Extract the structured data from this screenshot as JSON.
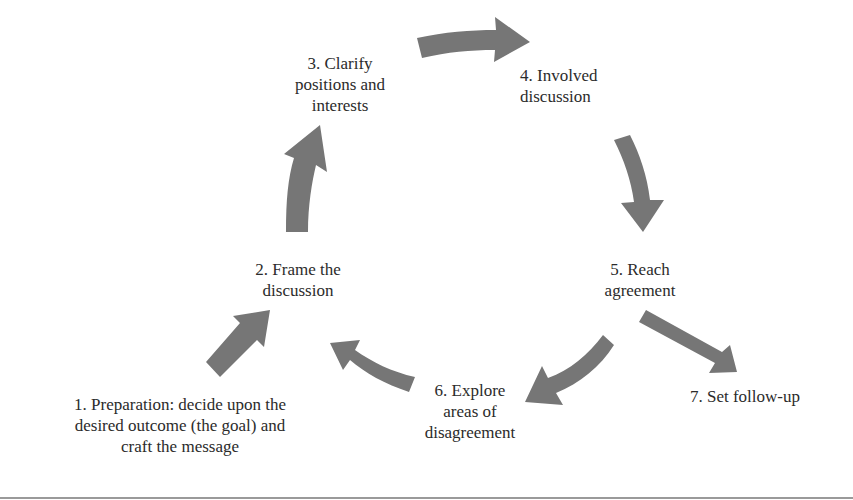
{
  "diagram": {
    "type": "process-cycle",
    "arrow_color": "#767676",
    "text_color": "#2b2b2b",
    "steps": [
      {
        "id": 1,
        "label": "1. Preparation: decide upon the\ndesired outcome (the goal) and\ncraft the message"
      },
      {
        "id": 2,
        "label": "2. Frame the\ndiscussion"
      },
      {
        "id": 3,
        "label": "3. Clarify\npositions and\ninterests"
      },
      {
        "id": 4,
        "label": "4. Involved\ndiscussion"
      },
      {
        "id": 5,
        "label": "5. Reach\nagreement"
      },
      {
        "id": 6,
        "label": "6. Explore\nareas of\ndisagreement"
      },
      {
        "id": 7,
        "label": "7. Set follow-up"
      }
    ],
    "connections": [
      {
        "from": 1,
        "to": 2
      },
      {
        "from": 2,
        "to": 3
      },
      {
        "from": 3,
        "to": 4
      },
      {
        "from": 4,
        "to": 5
      },
      {
        "from": 5,
        "to": 6
      },
      {
        "from": 6,
        "to": 2
      },
      {
        "from": 5,
        "to": 7
      }
    ]
  }
}
